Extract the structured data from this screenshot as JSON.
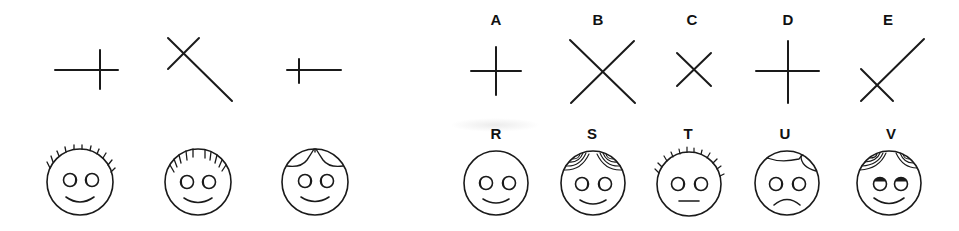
{
  "figure": {
    "colors": {
      "ink": "#1a1a1a",
      "background": "#ffffff"
    }
  },
  "samples": {
    "crosses": [
      {
        "id": "sample-cross-1",
        "shape": "plus with long left arm"
      },
      {
        "id": "sample-cross-2",
        "shape": "x with long lower-right arm"
      },
      {
        "id": "sample-cross-3",
        "shape": "plus with long right arm"
      }
    ],
    "faces": [
      {
        "id": "sample-face-1",
        "hair": "spiky",
        "mouth": "smile"
      },
      {
        "id": "sample-face-2",
        "hair": "fringe strokes",
        "mouth": "smile"
      },
      {
        "id": "sample-face-3",
        "hair": "two curls",
        "mouth": "smile"
      }
    ]
  },
  "options": {
    "crosses": [
      {
        "label": "A",
        "shape": "small plus"
      },
      {
        "label": "B",
        "shape": "large x"
      },
      {
        "label": "C",
        "shape": "small x"
      },
      {
        "label": "D",
        "shape": "large plus"
      },
      {
        "label": "E",
        "shape": "x with long upper-right arm"
      }
    ],
    "faces": [
      {
        "label": "R",
        "hair": "none",
        "mouth": "smile"
      },
      {
        "label": "S",
        "hair": "curly concentric",
        "mouth": "smile"
      },
      {
        "label": "T",
        "hair": "spiky",
        "mouth": "straight"
      },
      {
        "label": "U",
        "hair": "two curls",
        "mouth": "frown"
      },
      {
        "label": "V",
        "hair": "curly concentric",
        "mouth": "smile",
        "eyes": "looking up"
      }
    ]
  }
}
